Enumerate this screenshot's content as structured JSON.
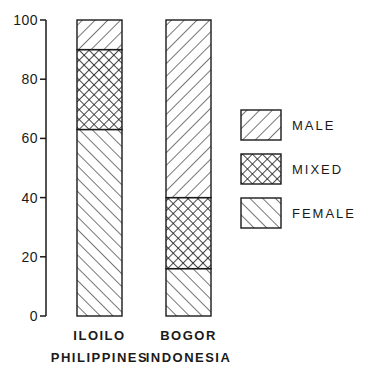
{
  "chart_data": {
    "type": "bar",
    "stacked": true,
    "title": "",
    "xlabel": "",
    "ylabel": "",
    "ylim": [
      0,
      100
    ],
    "yticks": [
      0,
      20,
      40,
      60,
      80,
      100
    ],
    "grid": false,
    "legend_position": "right",
    "categories": [
      {
        "line1": "ILOILO",
        "line2": "PHILIPPINES"
      },
      {
        "line1": "BOGOR",
        "line2": "INDONESIA"
      }
    ],
    "series": [
      {
        "name": "FEMALE",
        "pattern": "diagonal-backslash",
        "values": [
          63,
          16
        ]
      },
      {
        "name": "MIXED",
        "pattern": "crosshatch",
        "values": [
          27,
          24
        ]
      },
      {
        "name": "MALE",
        "pattern": "diagonal-slash",
        "values": [
          10,
          60
        ]
      }
    ],
    "legend": [
      "MALE",
      "MIXED",
      "FEMALE"
    ]
  },
  "colors": {
    "ink": "#1a1a1a",
    "background": "#ffffff"
  }
}
